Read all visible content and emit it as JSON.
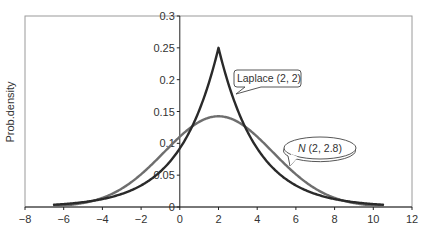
{
  "chart_data": {
    "type": "line",
    "title": "",
    "xlabel": "",
    "ylabel": "Prob.density",
    "xlim": [
      -8,
      12
    ],
    "ylim": [
      0,
      0.3
    ],
    "xticks": [
      -8,
      -6,
      -4,
      -2,
      0,
      2,
      4,
      6,
      8,
      10,
      12
    ],
    "xtick_labels": [
      "−8",
      "−6",
      "−4",
      "−2",
      "0",
      "2",
      "4",
      "6",
      "8",
      "10",
      "12"
    ],
    "yticks": [
      0,
      0.05,
      0.1,
      0.15,
      0.2,
      0.25,
      0.3
    ],
    "ytick_labels": [
      "0",
      "0.05",
      "0.1",
      "0.15",
      "0.2",
      "0.25",
      "0.3"
    ],
    "grid": false,
    "legend": "none",
    "series": [
      {
        "name": "Laplace (2, 2)",
        "distribution": "laplace",
        "location": 2,
        "scale": 2,
        "x_range": [
          -6.5,
          10.5
        ],
        "peak": 0.25,
        "color": "#2a2a2a"
      },
      {
        "name": "N (2, 2.8)",
        "distribution": "normal",
        "mean": 2,
        "sd": 2.8,
        "x_range": [
          -6.5,
          10.5
        ],
        "peak": 0.142,
        "color": "#6e6e6e"
      }
    ],
    "annotations": [
      {
        "label": "Laplace (2, 2)",
        "points_to": [
          2.9,
          0.18
        ],
        "shape": "rounded-rect"
      },
      {
        "label_italic": "N",
        "label_rest": " (2, 2.8)",
        "points_to": [
          5.7,
          0.085
        ],
        "shape": "ellipse"
      }
    ]
  }
}
